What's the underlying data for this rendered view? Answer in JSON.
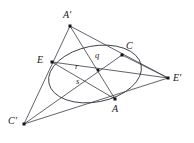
{
  "figure": {
    "type": "geometry-diagram",
    "width": 194,
    "height": 143,
    "background_color": "#ffffff",
    "stroke_color": "#3a3a44",
    "vertex_color": "#111116",
    "label_color": "#16161c"
  },
  "points": [
    {
      "id": "A-prime",
      "label": "A'",
      "x": 70,
      "y": 26,
      "label_x": 63,
      "label_y": 10
    },
    {
      "id": "E",
      "label": "E",
      "x": 52,
      "y": 62,
      "label_x": 37,
      "label_y": 55
    },
    {
      "id": "C",
      "label": "C",
      "x": 122,
      "y": 55,
      "label_x": 126,
      "label_y": 41
    },
    {
      "id": "E-prime",
      "label": "E'",
      "x": 168,
      "y": 78,
      "label_x": 173,
      "label_y": 73
    },
    {
      "id": "A",
      "label": "A",
      "x": 115,
      "y": 99,
      "label_x": 112,
      "label_y": 104
    },
    {
      "id": "C-prime",
      "label": "C'",
      "x": 24,
      "y": 124,
      "label_x": 8,
      "label_y": 116
    },
    {
      "id": "O",
      "label": "",
      "x": 98,
      "y": 70,
      "label_x": 0,
      "label_y": 0
    }
  ],
  "segment_labels": [
    {
      "id": "r",
      "label": "r",
      "x": 75,
      "y": 62
    },
    {
      "id": "q",
      "label": "q",
      "x": 95,
      "y": 51
    },
    {
      "id": "s",
      "label": "s",
      "x": 76,
      "y": 77
    }
  ],
  "lines": [
    {
      "id": "line-Aprime-Cprime",
      "from": "A-prime",
      "to": "C-prime"
    },
    {
      "id": "line-Aprime-Eprime",
      "from": "A-prime",
      "to": "E-prime"
    },
    {
      "id": "line-Aprime-A",
      "from": "A-prime",
      "to": "A"
    },
    {
      "id": "line-E-Eprime",
      "from": "E",
      "to": "E-prime"
    },
    {
      "id": "line-E-A",
      "from": "E",
      "to": "A"
    },
    {
      "id": "line-Cprime-C",
      "from": "C-prime",
      "to": "C"
    },
    {
      "id": "line-Cprime-Eprime",
      "from": "C-prime",
      "to": "E-prime"
    },
    {
      "id": "line-C-Eprime",
      "from": "C",
      "to": "E-prime"
    }
  ],
  "conic": {
    "id": "ellipse-through-E-C-A",
    "center_x": 95,
    "center_y": 74,
    "radius_x": 47,
    "radius_y": 28,
    "rotation_deg": -11
  }
}
